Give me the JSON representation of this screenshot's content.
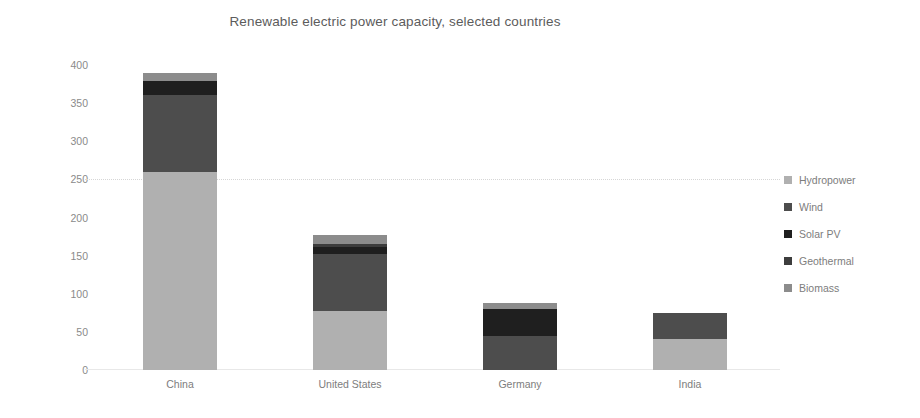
{
  "chart_data": {
    "type": "bar",
    "subtype": "stacked-bar",
    "title": "Renewable electric power capacity, selected countries",
    "xlabel": "",
    "ylabel": "",
    "ylim": [
      0,
      400
    ],
    "ytick_step": 50,
    "ytick_labels": [
      "400",
      "350",
      "300",
      "250",
      "200",
      "150",
      "100",
      "50",
      "0"
    ],
    "ytick_values": [
      400,
      350,
      300,
      250,
      200,
      150,
      100,
      50,
      0
    ],
    "grid": true,
    "legend_position": "right",
    "categories": [
      "China",
      "United States",
      "Germany",
      "India"
    ],
    "series": [
      {
        "name": "Hydropower",
        "color": "#b0b0b0",
        "values": [
          260,
          78,
          0,
          41
        ]
      },
      {
        "name": "Wind",
        "color": "#4d4d4d",
        "values": [
          101,
          74,
          45,
          34
        ]
      },
      {
        "name": "Solar PV",
        "color": "#1f1f1f",
        "values": [
          18,
          9,
          35,
          0
        ]
      },
      {
        "name": "Geothermal",
        "color": "#3d3d3d",
        "values": [
          0,
          4,
          0,
          0
        ]
      },
      {
        "name": "Biomass",
        "color": "#8c8c8c",
        "values": [
          10,
          12,
          8,
          0
        ]
      }
    ],
    "totals": [
      389,
      177,
      88,
      75
    ]
  },
  "legend": {
    "items": [
      {
        "label": "Hydropower",
        "color": "#b0b0b0"
      },
      {
        "label": "Wind",
        "color": "#4d4d4d"
      },
      {
        "label": "Solar PV",
        "color": "#1f1f1f"
      },
      {
        "label": "Geothermal",
        "color": "#3d3d3d"
      },
      {
        "label": "Biomass",
        "color": "#8c8c8c"
      }
    ]
  }
}
